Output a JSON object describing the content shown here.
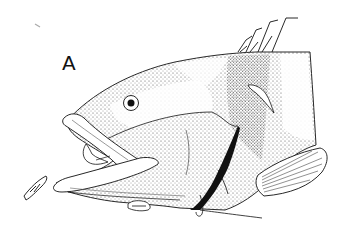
{
  "figure": {
    "panel_label": "A",
    "style": "stipple line drawing",
    "colors": {
      "ink": "#111111",
      "background": "#ffffff",
      "stipple": "#333333"
    }
  }
}
